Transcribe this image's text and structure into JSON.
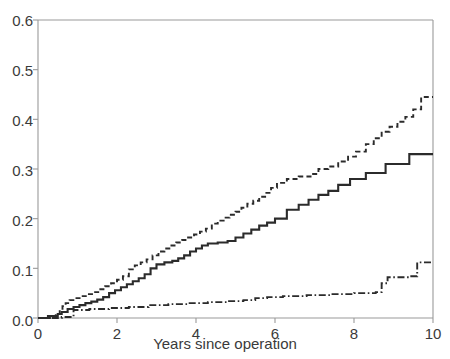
{
  "chart_data": {
    "type": "line",
    "title": "",
    "subtitle": "",
    "xlabel": "Years since operation",
    "ylabel": "",
    "xlim": [
      0,
      10
    ],
    "ylim": [
      0,
      0.6
    ],
    "xticks": [
      0,
      2,
      4,
      6,
      8,
      10
    ],
    "xtick_labels": [
      "0",
      "2",
      "4",
      "6",
      "8",
      "10"
    ],
    "yticks": [
      0.0,
      0.1,
      0.2,
      0.3,
      0.4,
      0.5,
      0.6
    ],
    "ytick_labels": [
      "0.0",
      "0.1",
      "0.2",
      "0.3",
      "0.4",
      "0.5",
      "0.6"
    ],
    "grid": false,
    "legend": "none",
    "step_style": "post",
    "annotations": [],
    "series": [
      {
        "name": "curve-dashed-upper",
        "style": "dashed",
        "color": "#2b2b2b",
        "final_value": 0.445,
        "points": [
          [
            0.0,
            0.0
          ],
          [
            0.25,
            0.004
          ],
          [
            0.45,
            0.008
          ],
          [
            0.55,
            0.016
          ],
          [
            0.62,
            0.024
          ],
          [
            0.7,
            0.03
          ],
          [
            0.8,
            0.036
          ],
          [
            0.95,
            0.04
          ],
          [
            1.1,
            0.044
          ],
          [
            1.25,
            0.048
          ],
          [
            1.4,
            0.052
          ],
          [
            1.55,
            0.058
          ],
          [
            1.7,
            0.064
          ],
          [
            1.85,
            0.07
          ],
          [
            2.0,
            0.077
          ],
          [
            2.15,
            0.084
          ],
          [
            2.3,
            0.098
          ],
          [
            2.45,
            0.106
          ],
          [
            2.6,
            0.112
          ],
          [
            2.75,
            0.118
          ],
          [
            2.9,
            0.126
          ],
          [
            3.05,
            0.134
          ],
          [
            3.2,
            0.14
          ],
          [
            3.35,
            0.146
          ],
          [
            3.5,
            0.152
          ],
          [
            3.65,
            0.157
          ],
          [
            3.8,
            0.162
          ],
          [
            3.95,
            0.168
          ],
          [
            4.1,
            0.174
          ],
          [
            4.25,
            0.18
          ],
          [
            4.4,
            0.19
          ],
          [
            4.55,
            0.196
          ],
          [
            4.7,
            0.202
          ],
          [
            4.85,
            0.208
          ],
          [
            5.0,
            0.214
          ],
          [
            5.15,
            0.222
          ],
          [
            5.3,
            0.23
          ],
          [
            5.45,
            0.236
          ],
          [
            5.6,
            0.244
          ],
          [
            5.75,
            0.252
          ],
          [
            5.9,
            0.262
          ],
          [
            6.05,
            0.272
          ],
          [
            6.3,
            0.28
          ],
          [
            6.6,
            0.285
          ],
          [
            6.9,
            0.29
          ],
          [
            7.1,
            0.3
          ],
          [
            7.35,
            0.305
          ],
          [
            7.6,
            0.315
          ],
          [
            7.85,
            0.325
          ],
          [
            8.05,
            0.335
          ],
          [
            8.3,
            0.35
          ],
          [
            8.5,
            0.362
          ],
          [
            8.7,
            0.375
          ],
          [
            8.9,
            0.385
          ],
          [
            9.1,
            0.395
          ],
          [
            9.3,
            0.405
          ],
          [
            9.5,
            0.42
          ],
          [
            9.7,
            0.445
          ],
          [
            10.0,
            0.445
          ]
        ]
      },
      {
        "name": "curve-solid-middle",
        "style": "solid",
        "color": "#2b2b2b",
        "final_value": 0.33,
        "points": [
          [
            0.0,
            0.0
          ],
          [
            0.3,
            0.004
          ],
          [
            0.5,
            0.008
          ],
          [
            0.6,
            0.012
          ],
          [
            0.75,
            0.018
          ],
          [
            0.9,
            0.022
          ],
          [
            1.05,
            0.026
          ],
          [
            1.2,
            0.03
          ],
          [
            1.35,
            0.033
          ],
          [
            1.5,
            0.037
          ],
          [
            1.65,
            0.042
          ],
          [
            1.8,
            0.05
          ],
          [
            1.95,
            0.056
          ],
          [
            2.1,
            0.062
          ],
          [
            2.25,
            0.068
          ],
          [
            2.4,
            0.074
          ],
          [
            2.55,
            0.08
          ],
          [
            2.7,
            0.088
          ],
          [
            2.85,
            0.1
          ],
          [
            3.0,
            0.108
          ],
          [
            3.2,
            0.112
          ],
          [
            3.4,
            0.115
          ],
          [
            3.55,
            0.12
          ],
          [
            3.7,
            0.126
          ],
          [
            3.85,
            0.134
          ],
          [
            4.0,
            0.14
          ],
          [
            4.15,
            0.146
          ],
          [
            4.3,
            0.15
          ],
          [
            4.55,
            0.152
          ],
          [
            4.8,
            0.155
          ],
          [
            5.0,
            0.162
          ],
          [
            5.2,
            0.17
          ],
          [
            5.4,
            0.178
          ],
          [
            5.6,
            0.186
          ],
          [
            5.8,
            0.192
          ],
          [
            6.0,
            0.2
          ],
          [
            6.3,
            0.218
          ],
          [
            6.6,
            0.228
          ],
          [
            6.85,
            0.238
          ],
          [
            7.1,
            0.248
          ],
          [
            7.35,
            0.256
          ],
          [
            7.6,
            0.268
          ],
          [
            7.9,
            0.28
          ],
          [
            8.3,
            0.292
          ],
          [
            8.8,
            0.31
          ],
          [
            9.4,
            0.33
          ],
          [
            10.0,
            0.33
          ]
        ]
      },
      {
        "name": "curve-dashdot-lower",
        "style": "dashdot",
        "color": "#2b2b2b",
        "final_value": 0.112,
        "points": [
          [
            0.0,
            0.0
          ],
          [
            0.6,
            0.002
          ],
          [
            0.9,
            0.016
          ],
          [
            1.3,
            0.018
          ],
          [
            1.8,
            0.02
          ],
          [
            2.3,
            0.022
          ],
          [
            2.8,
            0.026
          ],
          [
            3.3,
            0.028
          ],
          [
            3.8,
            0.03
          ],
          [
            4.3,
            0.032
          ],
          [
            4.8,
            0.034
          ],
          [
            5.2,
            0.036
          ],
          [
            5.5,
            0.04
          ],
          [
            5.8,
            0.042
          ],
          [
            6.2,
            0.044
          ],
          [
            6.8,
            0.046
          ],
          [
            7.4,
            0.048
          ],
          [
            8.0,
            0.05
          ],
          [
            8.55,
            0.052
          ],
          [
            8.7,
            0.07
          ],
          [
            8.85,
            0.082
          ],
          [
            9.45,
            0.084
          ],
          [
            9.6,
            0.112
          ],
          [
            10.0,
            0.112
          ]
        ]
      }
    ]
  },
  "axes": {
    "frame_color": "#9a9a9a",
    "line_color": "#2b2b2b",
    "background": "#ffffff"
  }
}
